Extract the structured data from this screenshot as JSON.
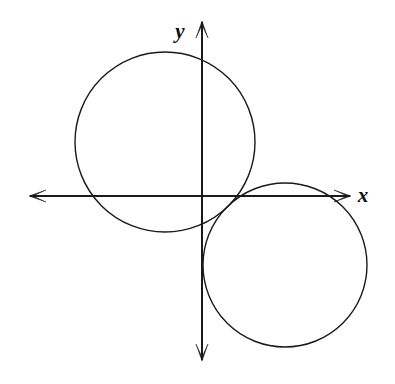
{
  "figure": {
    "background_color": "#ffffff",
    "stroke_color": "#1a1a1a",
    "width": 395,
    "height": 384
  },
  "axes": {
    "origin": {
      "x": 202,
      "y": 196
    },
    "x_axis": {
      "label": "x",
      "label_x": 363,
      "label_y": 197,
      "start_x": 30,
      "end_x": 350,
      "y": 196,
      "arrow_left": true,
      "arrow_right": true
    },
    "y_axis": {
      "label": "y",
      "label_x": 180,
      "label_y": 33,
      "start_y": 22,
      "end_y": 360,
      "x": 202,
      "arrow_up": true,
      "arrow_down": true
    }
  },
  "chart_data": {
    "type": "scatter",
    "xlabel": "x",
    "ylabel": "y",
    "grid": false,
    "legend": "none",
    "origin_px": {
      "x": 202,
      "y": 196
    },
    "shapes": [
      {
        "name": "upper-left-circle",
        "type": "circle",
        "center_px": {
          "x": 165,
          "y": 142
        },
        "radius_px": 90,
        "quadrant": "II",
        "stroke": "#1a1a1a",
        "fill": "none"
      },
      {
        "name": "lower-right-circle",
        "type": "circle",
        "center_px": {
          "x": 285,
          "y": 265
        },
        "radius_px": 82,
        "quadrant": "IV",
        "stroke": "#1a1a1a",
        "fill": "none"
      }
    ],
    "annotations": []
  }
}
